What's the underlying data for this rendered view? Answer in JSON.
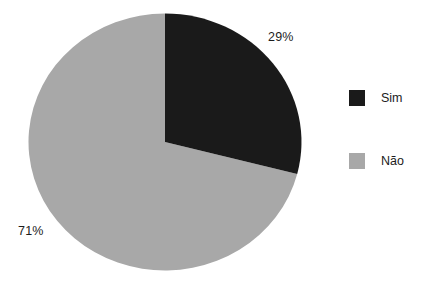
{
  "chart_data": {
    "type": "pie",
    "title": "",
    "categories": [
      "Sim",
      "Não"
    ],
    "values": [
      29,
      71
    ],
    "value_unit": "%",
    "data_labels": [
      "29%",
      "71%"
    ],
    "colors": [
      "#1a1a1a",
      "#a8a8a8"
    ],
    "start_angle_deg": 0,
    "direction": "clockwise",
    "legend": {
      "position": "right",
      "entries": [
        {
          "label": "Sim",
          "color": "#1a1a1a"
        },
        {
          "label": "Não",
          "color": "#a8a8a8"
        }
      ]
    },
    "grid": false,
    "xlabel": "",
    "ylabel": ""
  },
  "labels": {
    "sim_pct": "29%",
    "nao_pct": "71%"
  },
  "legend": {
    "sim_label": "Sim",
    "nao_label": "Não"
  },
  "colors": {
    "sim": "#1a1a1a",
    "nao": "#a8a8a8",
    "background": "#ffffff",
    "text": "#1c1c1c"
  }
}
